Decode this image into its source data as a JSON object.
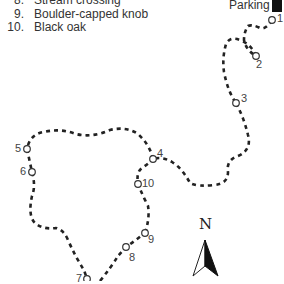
{
  "legend": {
    "items": [
      {
        "num": "8.",
        "label": "Stream crossing"
      },
      {
        "num": "9.",
        "label": "Boulder-capped knob"
      },
      {
        "num": "10.",
        "label": "Black oak"
      }
    ]
  },
  "parking": {
    "label": "Parking",
    "icon": "parking-square"
  },
  "compass": {
    "label": "N",
    "icon": "north-arrow"
  },
  "waypoints": [
    {
      "id": "1",
      "label": "1"
    },
    {
      "id": "2",
      "label": "2"
    },
    {
      "id": "3",
      "label": "3"
    },
    {
      "id": "4",
      "label": "4"
    },
    {
      "id": "5",
      "label": "5"
    },
    {
      "id": "6",
      "label": "6"
    },
    {
      "id": "7",
      "label": "7"
    },
    {
      "id": "8",
      "label": "8"
    },
    {
      "id": "9",
      "label": "9"
    },
    {
      "id": "10",
      "label": "10"
    }
  ],
  "colors": {
    "trail": "#222222",
    "text": "#333333",
    "parking": "#111111"
  }
}
